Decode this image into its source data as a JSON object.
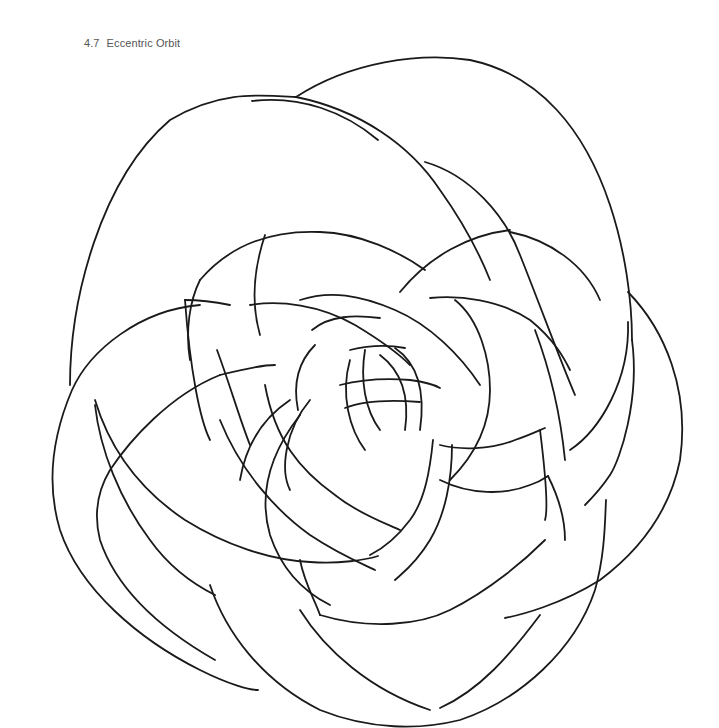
{
  "caption": {
    "number": "4.7",
    "title": "Eccentric Orbit"
  },
  "artwork": {
    "subject": "celtic-knot-line-drawing",
    "style": "black outline on white, uncolored coloring page",
    "stroke_color": "#1a1a1a",
    "background_color": "#ffffff"
  }
}
